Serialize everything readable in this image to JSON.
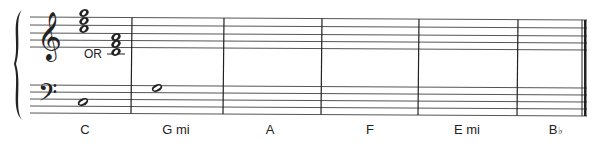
{
  "score": {
    "system": {
      "treble_staff_y": [
        17,
        25,
        33,
        40,
        47
      ],
      "bass_staff_y": [
        85,
        92,
        99,
        106,
        113
      ],
      "staff_left_x": 30,
      "staff_right_x": 587,
      "barlines_x": [
        132,
        224,
        322,
        419,
        518
      ],
      "final_barline_x": 586,
      "ink_color": "#222222",
      "line_color": "#555555"
    },
    "clefs": {
      "treble": "treble-clef",
      "bass": "bass-clef"
    },
    "or_text": "OR",
    "measures": [
      {
        "chord_label": "C",
        "label_suffix": "",
        "label_x": 85,
        "treble_chords": [
          {
            "x": 84,
            "notes_y": [
              13,
              21,
              29
            ],
            "names": [
              "G5",
              "E5",
              "C5"
            ]
          },
          {
            "x": 116,
            "notes_y": [
              37,
              44,
              52
            ],
            "names": [
              "G4",
              "E4",
              "C4"
            ],
            "ledger_y": 54
          }
        ],
        "bass_notes": [
          {
            "x": 83,
            "y": 102,
            "name": "C3"
          }
        ]
      },
      {
        "chord_label": "G mi",
        "label_suffix": "",
        "label_x": 176,
        "treble_chords": [],
        "bass_notes": [
          {
            "x": 157,
            "y": 88,
            "name": "G3"
          }
        ]
      },
      {
        "chord_label": "A",
        "label_suffix": "",
        "label_x": 270,
        "treble_chords": [],
        "bass_notes": []
      },
      {
        "chord_label": "F",
        "label_suffix": "",
        "label_x": 370,
        "treble_chords": [],
        "bass_notes": []
      },
      {
        "chord_label": "E mi",
        "label_suffix": "",
        "label_x": 467,
        "treble_chords": [],
        "bass_notes": []
      },
      {
        "chord_label": "B",
        "label_suffix": "♭",
        "label_x": 556,
        "treble_chords": [],
        "bass_notes": []
      }
    ]
  }
}
